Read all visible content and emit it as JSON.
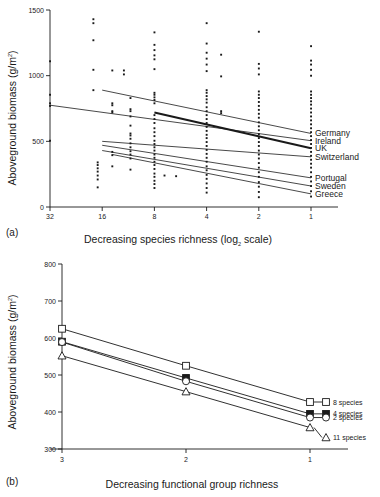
{
  "figure": {
    "panel_a_tag": "(a)",
    "panel_b_tag": "(b)"
  },
  "chart_data": [
    {
      "id": "panel-a",
      "type": "scatter",
      "title": "",
      "xlabel_prefix": "Decreasing species richness (log",
      "xlabel_sub": "2",
      "xlabel_suffix": " scale)",
      "ylabel_prefix": "Aboveground biomass (g/m",
      "ylabel_sup": "2",
      "ylabel_suffix": ")",
      "ylim": [
        0,
        1500
      ],
      "yticks": [
        0,
        500,
        1000,
        1500
      ],
      "ytick_labels": [
        "0",
        "500",
        "1000",
        "1500"
      ],
      "xticks": [
        32,
        16,
        8,
        4,
        2,
        1
      ],
      "xtick_labels": [
        "32",
        "16",
        "8",
        "4",
        "2",
        "1"
      ],
      "grid": false,
      "legend_position": "right",
      "legend": [
        {
          "label": "Germany",
          "y_at_x1": 560
        },
        {
          "label": "Ireland",
          "y_at_x1": 505
        },
        {
          "label": "UK",
          "y_at_x1": 448
        },
        {
          "label": "Switzerland",
          "y_at_x1": 382
        },
        {
          "label": "Portugal",
          "y_at_x1": 222
        },
        {
          "label": "Sweden",
          "y_at_x1": 160
        },
        {
          "label": "Greece",
          "y_at_x1": 100
        }
      ],
      "regression_lines": [
        {
          "name": "Germany",
          "x_start": 16,
          "x_end": 1,
          "y_start": 890,
          "y_end": 560,
          "bold": false
        },
        {
          "name": "Ireland",
          "x_start": 32,
          "x_end": 1,
          "y_start": 775,
          "y_end": 505,
          "bold": false
        },
        {
          "name": "UK",
          "x_start": 8,
          "x_end": 1,
          "y_start": 720,
          "y_end": 448,
          "bold": true
        },
        {
          "name": "Switzerland",
          "x_start": 16,
          "x_end": 1,
          "y_start": 500,
          "y_end": 382,
          "bold": false
        },
        {
          "name": "Portugal",
          "x_start": 16,
          "x_end": 1,
          "y_start": 470,
          "y_end": 222,
          "bold": false
        },
        {
          "name": "Sweden",
          "x_start": 16,
          "x_end": 1,
          "y_start": 430,
          "y_end": 160,
          "bold": false
        },
        {
          "name": "Greece",
          "x_start": 14,
          "x_end": 1,
          "y_start": 400,
          "y_end": 100,
          "bold": false
        }
      ],
      "points": [
        {
          "x": 32,
          "y": 1110
        },
        {
          "x": 32,
          "y": 855
        },
        {
          "x": 32,
          "y": 790
        },
        {
          "x": 32,
          "y": 770
        },
        {
          "x": 32,
          "y": 505
        },
        {
          "x": 18,
          "y": 1430
        },
        {
          "x": 18,
          "y": 1400
        },
        {
          "x": 18,
          "y": 1270
        },
        {
          "x": 18,
          "y": 1045
        },
        {
          "x": 18,
          "y": 890
        },
        {
          "x": 17,
          "y": 340
        },
        {
          "x": 17,
          "y": 320
        },
        {
          "x": 17,
          "y": 295
        },
        {
          "x": 17,
          "y": 270
        },
        {
          "x": 17,
          "y": 240
        },
        {
          "x": 17,
          "y": 210
        },
        {
          "x": 17,
          "y": 150
        },
        {
          "x": 14,
          "y": 1040
        },
        {
          "x": 14,
          "y": 790
        },
        {
          "x": 14,
          "y": 775
        },
        {
          "x": 14,
          "y": 730
        },
        {
          "x": 14,
          "y": 720
        },
        {
          "x": 14,
          "y": 420
        },
        {
          "x": 14,
          "y": 395
        },
        {
          "x": 14,
          "y": 310
        },
        {
          "x": 12,
          "y": 1010
        },
        {
          "x": 12,
          "y": 1040
        },
        {
          "x": 11,
          "y": 830
        },
        {
          "x": 11,
          "y": 745
        },
        {
          "x": 11,
          "y": 730
        },
        {
          "x": 11,
          "y": 690
        },
        {
          "x": 11,
          "y": 620
        },
        {
          "x": 11,
          "y": 560
        },
        {
          "x": 11,
          "y": 545
        },
        {
          "x": 11,
          "y": 520
        },
        {
          "x": 11,
          "y": 485
        },
        {
          "x": 11,
          "y": 455
        },
        {
          "x": 11,
          "y": 425
        },
        {
          "x": 11,
          "y": 400
        },
        {
          "x": 11,
          "y": 370
        },
        {
          "x": 11,
          "y": 285
        },
        {
          "x": 8,
          "y": 1330
        },
        {
          "x": 8,
          "y": 1235
        },
        {
          "x": 8,
          "y": 1195
        },
        {
          "x": 8,
          "y": 1155
        },
        {
          "x": 8,
          "y": 1125
        },
        {
          "x": 8,
          "y": 1050
        },
        {
          "x": 8,
          "y": 870
        },
        {
          "x": 8,
          "y": 855
        },
        {
          "x": 8,
          "y": 835
        },
        {
          "x": 8,
          "y": 815
        },
        {
          "x": 8,
          "y": 790
        },
        {
          "x": 8,
          "y": 700
        },
        {
          "x": 8,
          "y": 670
        },
        {
          "x": 8,
          "y": 640
        },
        {
          "x": 8,
          "y": 600
        },
        {
          "x": 8,
          "y": 570
        },
        {
          "x": 8,
          "y": 540
        },
        {
          "x": 8,
          "y": 505
        },
        {
          "x": 8,
          "y": 480
        },
        {
          "x": 8,
          "y": 455
        },
        {
          "x": 8,
          "y": 430
        },
        {
          "x": 8,
          "y": 400
        },
        {
          "x": 8,
          "y": 375
        },
        {
          "x": 8,
          "y": 345
        },
        {
          "x": 8,
          "y": 320
        },
        {
          "x": 8,
          "y": 290
        },
        {
          "x": 8,
          "y": 255
        },
        {
          "x": 8,
          "y": 230
        },
        {
          "x": 8,
          "y": 200
        },
        {
          "x": 8,
          "y": 175
        },
        {
          "x": 8,
          "y": 145
        },
        {
          "x": 7,
          "y": 240
        },
        {
          "x": 6,
          "y": 235
        },
        {
          "x": 4,
          "y": 1400
        },
        {
          "x": 4,
          "y": 1245
        },
        {
          "x": 4,
          "y": 1175
        },
        {
          "x": 4,
          "y": 1130
        },
        {
          "x": 4,
          "y": 1085
        },
        {
          "x": 4,
          "y": 1035
        },
        {
          "x": 4,
          "y": 890
        },
        {
          "x": 4,
          "y": 870
        },
        {
          "x": 4,
          "y": 845
        },
        {
          "x": 4,
          "y": 820
        },
        {
          "x": 4,
          "y": 795
        },
        {
          "x": 4,
          "y": 760
        },
        {
          "x": 4,
          "y": 730
        },
        {
          "x": 4,
          "y": 700
        },
        {
          "x": 4,
          "y": 670
        },
        {
          "x": 4,
          "y": 640
        },
        {
          "x": 4,
          "y": 610
        },
        {
          "x": 4,
          "y": 580
        },
        {
          "x": 4,
          "y": 550
        },
        {
          "x": 4,
          "y": 525
        },
        {
          "x": 4,
          "y": 495
        },
        {
          "x": 4,
          "y": 465
        },
        {
          "x": 4,
          "y": 435
        },
        {
          "x": 4,
          "y": 405
        },
        {
          "x": 4,
          "y": 375
        },
        {
          "x": 4,
          "y": 345
        },
        {
          "x": 4,
          "y": 310
        },
        {
          "x": 4,
          "y": 280
        },
        {
          "x": 4,
          "y": 245
        },
        {
          "x": 4,
          "y": 215
        },
        {
          "x": 4,
          "y": 180
        },
        {
          "x": 4,
          "y": 145
        },
        {
          "x": 4,
          "y": 110
        },
        {
          "x": 3.3,
          "y": 1160
        },
        {
          "x": 3.3,
          "y": 995
        },
        {
          "x": 3.3,
          "y": 730
        },
        {
          "x": 3.3,
          "y": 715
        },
        {
          "x": 2,
          "y": 1335
        },
        {
          "x": 2,
          "y": 1090
        },
        {
          "x": 2,
          "y": 1055
        },
        {
          "x": 2,
          "y": 1010
        },
        {
          "x": 2,
          "y": 880
        },
        {
          "x": 2,
          "y": 855
        },
        {
          "x": 2,
          "y": 830
        },
        {
          "x": 2,
          "y": 800
        },
        {
          "x": 2,
          "y": 770
        },
        {
          "x": 2,
          "y": 740
        },
        {
          "x": 2,
          "y": 710
        },
        {
          "x": 2,
          "y": 680
        },
        {
          "x": 2,
          "y": 645
        },
        {
          "x": 2,
          "y": 615
        },
        {
          "x": 2,
          "y": 585
        },
        {
          "x": 2,
          "y": 555
        },
        {
          "x": 2,
          "y": 525
        },
        {
          "x": 2,
          "y": 495
        },
        {
          "x": 2,
          "y": 465
        },
        {
          "x": 2,
          "y": 430
        },
        {
          "x": 2,
          "y": 400
        },
        {
          "x": 2,
          "y": 370
        },
        {
          "x": 2,
          "y": 335
        },
        {
          "x": 2,
          "y": 300
        },
        {
          "x": 2,
          "y": 265
        },
        {
          "x": 2,
          "y": 230
        },
        {
          "x": 2,
          "y": 190
        },
        {
          "x": 2,
          "y": 155
        },
        {
          "x": 2,
          "y": 115
        },
        {
          "x": 2,
          "y": 75
        },
        {
          "x": 1,
          "y": 1225
        },
        {
          "x": 1,
          "y": 1115
        },
        {
          "x": 1,
          "y": 1085
        },
        {
          "x": 1,
          "y": 1045
        },
        {
          "x": 1,
          "y": 1000
        },
        {
          "x": 1,
          "y": 880
        },
        {
          "x": 1,
          "y": 855
        },
        {
          "x": 1,
          "y": 830
        },
        {
          "x": 1,
          "y": 805
        },
        {
          "x": 1,
          "y": 780
        },
        {
          "x": 1,
          "y": 750
        },
        {
          "x": 1,
          "y": 720
        },
        {
          "x": 1,
          "y": 690
        },
        {
          "x": 1,
          "y": 660
        },
        {
          "x": 1,
          "y": 630
        },
        {
          "x": 1,
          "y": 600
        },
        {
          "x": 1,
          "y": 570
        },
        {
          "x": 1,
          "y": 540
        },
        {
          "x": 1,
          "y": 510
        },
        {
          "x": 1,
          "y": 480
        },
        {
          "x": 1,
          "y": 450
        },
        {
          "x": 1,
          "y": 420
        },
        {
          "x": 1,
          "y": 390
        },
        {
          "x": 1,
          "y": 360
        },
        {
          "x": 1,
          "y": 330
        },
        {
          "x": 1,
          "y": 300
        },
        {
          "x": 1,
          "y": 265
        },
        {
          "x": 1,
          "y": 230
        },
        {
          "x": 1,
          "y": 195
        },
        {
          "x": 1,
          "y": 160
        },
        {
          "x": 1,
          "y": 120
        },
        {
          "x": 1,
          "y": 80
        }
      ]
    },
    {
      "id": "panel-b",
      "type": "line",
      "title": "",
      "xlabel": "Decreasing functional group richness",
      "ylabel_prefix": "Aboveground biomass (g/m",
      "ylabel_sup": "2",
      "ylabel_suffix": ")",
      "ylim": [
        300,
        800
      ],
      "yticks": [
        300,
        400,
        500,
        600,
        700,
        800
      ],
      "ytick_labels": [
        "300",
        "400",
        "500",
        "600",
        "700",
        "800"
      ],
      "xticks": [
        3,
        2,
        1
      ],
      "xtick_labels": [
        "3",
        "2",
        "1"
      ],
      "categories": [
        "3",
        "2",
        "1"
      ],
      "grid": false,
      "legend_position": "right",
      "series": [
        {
          "name": "8 species",
          "marker": "open-square",
          "values": [
            625,
            525,
            427
          ]
        },
        {
          "name": "4 species",
          "marker": "filled-square",
          "values": [
            590,
            492,
            395
          ]
        },
        {
          "name": "2 species",
          "marker": "open-circle",
          "values": [
            589,
            483,
            385
          ]
        },
        {
          "name": "11 species",
          "marker": "open-triangle",
          "values": [
            552,
            455,
            358
          ]
        }
      ]
    }
  ]
}
